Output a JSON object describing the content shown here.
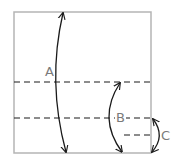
{
  "diagram": {
    "type": "origami-folding-diagram",
    "paper": {
      "shape": "square",
      "x": 14,
      "y": 12,
      "width": 137,
      "height": 141,
      "stroke_color": "#b5b5b5"
    },
    "fold_lines": [
      {
        "id": "fold-line-1",
        "style": "dashed",
        "y": 82,
        "x1": 14,
        "x2": 151
      },
      {
        "id": "fold-line-2",
        "style": "dashed",
        "y": 118,
        "x1": 14,
        "x2": 151
      },
      {
        "id": "fold-line-3",
        "style": "dashed",
        "y": 135,
        "x1": 124,
        "x2": 151
      }
    ],
    "arrows": [
      {
        "id": "arrow-a",
        "label": "A",
        "from": [
          64,
          12
        ],
        "to": [
          66,
          153
        ],
        "curve_bulge_x": 55,
        "bidirectional": true
      },
      {
        "id": "arrow-b",
        "label": "B",
        "from": [
          120,
          82
        ],
        "to": [
          122,
          153
        ],
        "curve_bulge_x": 108,
        "bidirectional": true
      },
      {
        "id": "arrow-c",
        "label": "C",
        "from": [
          153,
          118
        ],
        "to": [
          153,
          153
        ],
        "curve_bulge_x": 161,
        "bidirectional": true
      }
    ],
    "labels": {
      "a": "A",
      "b": "B",
      "c": "C"
    },
    "colors": {
      "paper_edge": "#b5b5b5",
      "fold_line": "#1a1a1a",
      "arrow": "#1a1a1a",
      "label_text": "#7a7a7a"
    }
  }
}
